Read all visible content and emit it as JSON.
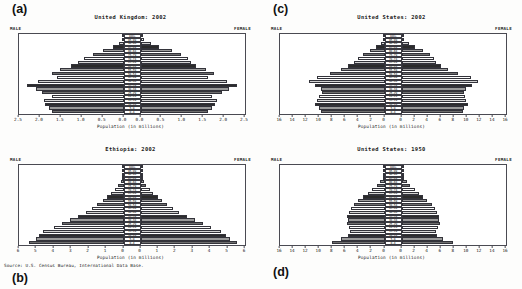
{
  "figure": {
    "source_note": "Source: U.S. Census Bureau, International Data Base.",
    "axis_title": "Population (in millions)",
    "male_label": "MALE",
    "female_label": "FEMALE",
    "panel_letters": {
      "a": "(a)",
      "b": "(b)",
      "c": "(c)",
      "d": "(d)"
    }
  },
  "age_groups": [
    "100+",
    "95-99",
    "90-94",
    "85-89",
    "80-84",
    "75-79",
    "70-74",
    "65-69",
    "60-64",
    "55-59",
    "50-54",
    "45-49",
    "40-44",
    "35-39",
    "30-34",
    "25-29",
    "20-24",
    "15-19",
    "10-14",
    "5-9",
    "0-4"
  ],
  "chart_data": [
    {
      "id": "a",
      "type": "bar",
      "title": "United Kingdom: 2002",
      "xlabel": "Population (in millions)",
      "ylabel": "",
      "xlim": [
        -2.5,
        2.5
      ],
      "ticks": [
        "2.5",
        "2.0",
        "1.5",
        "1.0",
        "0.5",
        "0.0",
        "0.0",
        "0.5",
        "1.0",
        "1.5",
        "2.0",
        "2.5"
      ],
      "tick_values": [
        2.5,
        2.0,
        1.5,
        1.0,
        0.5,
        0.0,
        0.0,
        0.5,
        1.0,
        1.5,
        2.0,
        2.5
      ],
      "grid": false,
      "categories": [
        "100+",
        "95-99",
        "90-94",
        "85-89",
        "80-84",
        "75-79",
        "70-74",
        "65-69",
        "60-64",
        "55-59",
        "50-54",
        "45-49",
        "40-44",
        "35-39",
        "30-34",
        "25-29",
        "20-24",
        "15-19",
        "10-14",
        "5-9",
        "0-4"
      ],
      "series": [
        {
          "name": "MALE",
          "side": "left",
          "values": [
            0.004,
            0.03,
            0.1,
            0.25,
            0.5,
            0.73,
            0.95,
            1.08,
            1.25,
            1.52,
            1.72,
            1.58,
            2.05,
            2.3,
            2.1,
            1.95,
            1.72,
            1.9,
            1.88,
            1.78,
            1.7
          ]
        },
        {
          "name": "FEMALE",
          "side": "right",
          "values": [
            0.018,
            0.09,
            0.24,
            0.45,
            0.76,
            0.96,
            1.13,
            1.2,
            1.32,
            1.57,
            1.76,
            1.62,
            2.08,
            2.32,
            2.12,
            1.95,
            1.7,
            1.82,
            1.79,
            1.7,
            1.62
          ]
        }
      ]
    },
    {
      "id": "b",
      "type": "bar",
      "title": "Ethiopia: 2002",
      "xlabel": "Population (in millions)",
      "ylabel": "",
      "xlim": [
        -6,
        6
      ],
      "ticks": [
        "6",
        "5",
        "4",
        "3",
        "2",
        "1",
        "0",
        "0",
        "1",
        "2",
        "3",
        "4",
        "5",
        "6"
      ],
      "tick_values": [
        6,
        5,
        4,
        3,
        2,
        1,
        0,
        0,
        1,
        2,
        3,
        4,
        5,
        6
      ],
      "grid": false,
      "categories": [
        "100+",
        "95-99",
        "90-94",
        "85-89",
        "80-84",
        "75-79",
        "70-74",
        "65-69",
        "60-64",
        "55-59",
        "50-54",
        "45-49",
        "40-44",
        "35-39",
        "30-34",
        "25-29",
        "20-24",
        "15-19",
        "10-14",
        "5-9",
        "0-4"
      ],
      "series": [
        {
          "name": "MALE",
          "side": "left",
          "values": [
            0.003,
            0.01,
            0.03,
            0.08,
            0.17,
            0.3,
            0.48,
            0.7,
            0.95,
            1.2,
            1.5,
            1.8,
            2.15,
            2.6,
            3.1,
            3.55,
            4.0,
            4.6,
            4.85,
            5.05,
            5.4
          ]
        },
        {
          "name": "FEMALE",
          "side": "right",
          "values": [
            0.004,
            0.012,
            0.035,
            0.09,
            0.19,
            0.33,
            0.52,
            0.74,
            1.0,
            1.25,
            1.55,
            1.85,
            2.2,
            2.65,
            3.15,
            3.6,
            4.05,
            4.65,
            4.9,
            5.15,
            5.55
          ]
        }
      ]
    },
    {
      "id": "c",
      "type": "bar",
      "title": "United States: 2002",
      "xlabel": "Population (in millions)",
      "ylabel": "",
      "xlim": [
        -16,
        16
      ],
      "ticks": [
        "16",
        "14",
        "12",
        "10",
        "8",
        "6",
        "4",
        "2",
        "0",
        "0",
        "2",
        "4",
        "6",
        "8",
        "10",
        "12",
        "14",
        "16"
      ],
      "tick_values": [
        16,
        14,
        12,
        10,
        8,
        6,
        4,
        2,
        0,
        0,
        2,
        4,
        6,
        8,
        10,
        12,
        14,
        16
      ],
      "grid": false,
      "categories": [
        "100+",
        "95-99",
        "90-94",
        "85-89",
        "80-84",
        "75-79",
        "70-74",
        "65-69",
        "60-64",
        "55-59",
        "50-54",
        "45-49",
        "40-44",
        "35-39",
        "30-34",
        "25-29",
        "20-24",
        "15-19",
        "10-14",
        "5-9",
        "0-4"
      ],
      "series": [
        {
          "name": "MALE",
          "side": "left",
          "values": [
            0.02,
            0.2,
            0.6,
            1.3,
            2.2,
            3.3,
            4.1,
            4.7,
            5.6,
            6.7,
            8.4,
            10.3,
            11.5,
            10.6,
            9.8,
            9.6,
            10.0,
            10.4,
            10.7,
            10.0,
            9.8
          ]
        },
        {
          "name": "FEMALE",
          "side": "right",
          "values": [
            0.07,
            0.45,
            1.1,
            2.1,
            3.3,
            4.3,
            4.9,
            5.3,
            6.1,
            7.1,
            8.7,
            10.6,
            11.7,
            10.8,
            9.9,
            9.6,
            9.7,
            9.9,
            10.2,
            9.6,
            9.4
          ]
        }
      ]
    },
    {
      "id": "d",
      "type": "bar",
      "title": "United States: 1950",
      "xlabel": "Population (in millions)",
      "ylabel": "",
      "xlim": [
        -16,
        16
      ],
      "ticks": [
        "16",
        "14",
        "12",
        "10",
        "8",
        "6",
        "4",
        "2",
        "0",
        "0",
        "2",
        "4",
        "6",
        "8",
        "10",
        "12",
        "14",
        "16"
      ],
      "tick_values": [
        16,
        14,
        12,
        10,
        8,
        6,
        4,
        2,
        0,
        0,
        2,
        4,
        6,
        8,
        10,
        12,
        14,
        16
      ],
      "grid": false,
      "categories": [
        "100+",
        "95-99",
        "90-94",
        "85-89",
        "80-84",
        "75-79",
        "70-74",
        "65-69",
        "60-64",
        "55-59",
        "50-54",
        "45-49",
        "40-44",
        "35-39",
        "30-34",
        "25-29",
        "20-24",
        "15-19",
        "10-14",
        "5-9",
        "0-4"
      ],
      "series": [
        {
          "name": "MALE",
          "side": "left",
          "values": [
            0.003,
            0.02,
            0.1,
            0.3,
            0.7,
            1.2,
            1.9,
            2.6,
            3.3,
            4.0,
            4.7,
            5.2,
            5.5,
            5.7,
            5.6,
            5.7,
            5.5,
            5.3,
            5.6,
            6.6,
            8.1
          ]
        },
        {
          "name": "FEMALE",
          "side": "right",
          "values": [
            0.006,
            0.03,
            0.13,
            0.36,
            0.8,
            1.3,
            2.0,
            2.7,
            3.3,
            3.95,
            4.6,
            5.1,
            5.45,
            5.75,
            5.7,
            5.85,
            5.65,
            5.35,
            5.5,
            6.4,
            7.85
          ]
        }
      ]
    }
  ]
}
